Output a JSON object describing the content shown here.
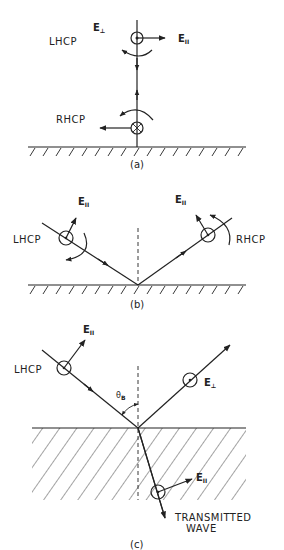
{
  "figure": {
    "panels": [
      {
        "id": "a",
        "caption": "(a)",
        "labels": {
          "incident_polarization": "LHCP",
          "reflected_polarization": "RHCP",
          "e_perp": "E",
          "e_perp_sub": "⊥",
          "e_par": "E",
          "e_par_sub": "II"
        }
      },
      {
        "id": "b",
        "caption": "(b)",
        "labels": {
          "incident_polarization": "LHCP",
          "reflected_polarization": "RHCP",
          "e_par_incident": "E",
          "e_par_incident_sub": "II",
          "e_par_reflected": "E",
          "e_par_reflected_sub": "II"
        }
      },
      {
        "id": "c",
        "caption": "(c)",
        "labels": {
          "incident_polarization": "LHCP",
          "e_par_incident": "E",
          "e_par_incident_sub": "II",
          "e_perp_reflected": "E",
          "e_perp_reflected_sub": "⊥",
          "angle": "θ",
          "angle_sub": "B",
          "e_par_transmitted": "E",
          "e_par_transmitted_sub": "II",
          "transmitted_line1": "TRANSMITTED",
          "transmitted_line2": "WAVE"
        }
      }
    ]
  }
}
